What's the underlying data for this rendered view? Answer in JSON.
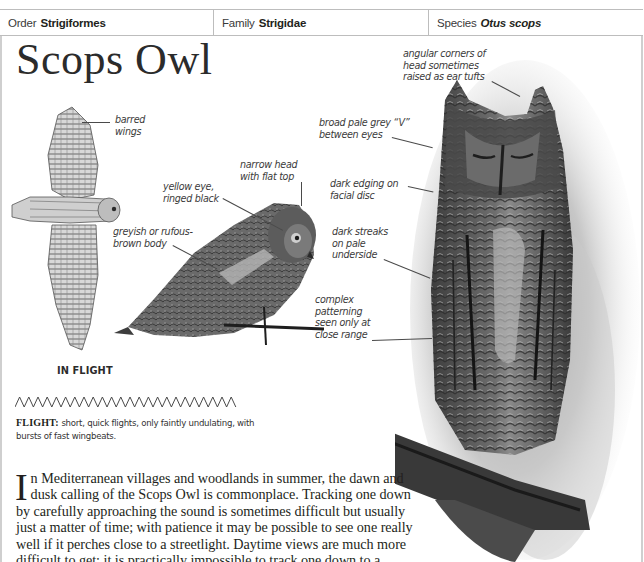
{
  "taxonomy": {
    "order_label": "Order",
    "order_value": "Strigiformes",
    "family_label": "Family",
    "family_value": "Strigidae",
    "species_label": "Species",
    "species_value": "Otus scops"
  },
  "title": "Scops Owl",
  "illustrations": {
    "flight": {
      "caption": "IN FLIGHT",
      "annotations": [
        {
          "id": "barred-wings",
          "text": [
            "barred",
            "wings"
          ]
        }
      ]
    },
    "perched": {
      "annotations": [
        {
          "id": "narrow-head",
          "text": [
            "narrow head",
            "with flat top"
          ]
        },
        {
          "id": "yellow-eye",
          "text": [
            "yellow eye,",
            "ringed black"
          ]
        },
        {
          "id": "body-colour",
          "text": [
            "greyish or rufous-",
            "brown body"
          ]
        }
      ]
    },
    "portrait": {
      "annotations": [
        {
          "id": "ear-tufts",
          "text": [
            "angular corners of",
            "head sometimes",
            "raised as ear tufts"
          ]
        },
        {
          "id": "pale-v",
          "text": [
            "broad pale grey “V”",
            "between eyes"
          ]
        },
        {
          "id": "facial-disc",
          "text": [
            "dark edging on",
            "facial disc"
          ]
        },
        {
          "id": "streaks",
          "text": [
            "dark streaks",
            "on pale",
            "underside"
          ]
        },
        {
          "id": "patterning",
          "text": [
            "complex",
            "patterning",
            "seen only at",
            "close range"
          ]
        }
      ]
    }
  },
  "flight_pattern": {
    "icon": "zigzag-flight-icon",
    "label": "FLIGHT:",
    "description": "short, quick flights, only faintly undulating, with bursts of fast wingbeats."
  },
  "body": {
    "drop_cap": "I",
    "text": "n Mediterranean villages and woodlands in summer, the dawn and dusk calling of the Scops Owl is commonplace. Tracking one down by carefully approaching the sound is sometimes difficult but usually just a matter of time; with patience it may be possible to see one really well if it perches close to a streetlight. Daytime views are much more difficult to get: it is practically impossible to track one down to a visible"
  },
  "colors": {
    "rule": "#bdbdbd",
    "text": "#231f20",
    "annotation": "#3b3b3b"
  }
}
